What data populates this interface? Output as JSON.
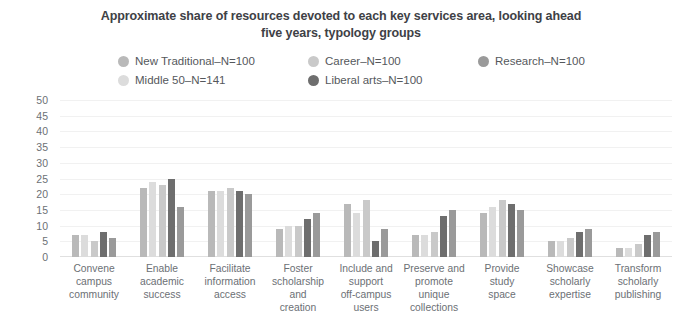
{
  "chart_data": {
    "type": "bar",
    "title": "Approximate share of resources devoted to each key services area, looking ahead five years, typology groups",
    "title_line1": "Approximate share of resources devoted to each key services area, looking ahead",
    "title_line2": "five years, typology groups",
    "xlabel": "",
    "ylabel": "",
    "ylim": [
      0,
      50
    ],
    "yticks": [
      50,
      45,
      40,
      35,
      30,
      25,
      20,
      15,
      10,
      5,
      0
    ],
    "grid": true,
    "legend_position": "top-center",
    "categories": [
      "Convene campus community",
      "Enable academic success",
      "Facilitate information access",
      "Foster scholarship and creation",
      "Include and support off-campus users",
      "Preserve and promote unique collections",
      "Provide study space",
      "Showcase scholarly expertise",
      "Transform scholarly publishing"
    ],
    "category_lines": [
      [
        "Convene",
        "campus",
        "community"
      ],
      [
        "Enable",
        "academic",
        "success"
      ],
      [
        "Facilitate",
        "information",
        "access"
      ],
      [
        "Foster",
        "scholarship",
        "and",
        "creation"
      ],
      [
        "Include and",
        "support",
        "off-campus",
        "users"
      ],
      [
        "Preserve and",
        "promote",
        "unique",
        "collections"
      ],
      [
        "Provide",
        "study",
        "space"
      ],
      [
        "Showcase",
        "scholarly",
        "expertise"
      ],
      [
        "Transform",
        "scholarly",
        "publishing"
      ]
    ],
    "series": [
      {
        "name": "New Traditional–N=100",
        "color": "#b9b9b9",
        "values": [
          7,
          22,
          21,
          9,
          17,
          7,
          14,
          5,
          3
        ]
      },
      {
        "name": "Middle 50–N=141",
        "color": "#dcdcdc",
        "values": [
          7,
          24,
          21,
          10,
          14,
          7,
          16,
          5,
          3
        ]
      },
      {
        "name": "Career–N=100",
        "color": "#c9c9c9",
        "values": [
          5,
          23,
          22,
          10,
          18,
          8,
          18,
          6,
          4
        ]
      },
      {
        "name": "Liberal arts–N=100",
        "color": "#6e6e6e",
        "values": [
          8,
          25,
          21,
          12,
          5,
          13,
          17,
          8,
          7
        ]
      },
      {
        "name": "Research–N=100",
        "color": "#9a9a9a",
        "values": [
          6,
          16,
          20,
          14,
          9,
          15,
          15,
          9,
          8
        ]
      }
    ],
    "bar_order": [
      "New Traditional–N=100",
      "Middle 50–N=141",
      "Career–N=100",
      "Liberal arts–N=100",
      "Research–N=100"
    ]
  },
  "legend": {
    "row1": [
      {
        "label": "New Traditional–N=100",
        "color": "#b9b9b9"
      },
      {
        "label": "Career–N=100",
        "color": "#c9c9c9"
      },
      {
        "label": "Research–N=100",
        "color": "#9a9a9a"
      }
    ],
    "row2": [
      {
        "label": "Middle 50–N=141",
        "color": "#dcdcdc"
      },
      {
        "label": "Liberal arts–N=100",
        "color": "#6e6e6e"
      }
    ]
  }
}
